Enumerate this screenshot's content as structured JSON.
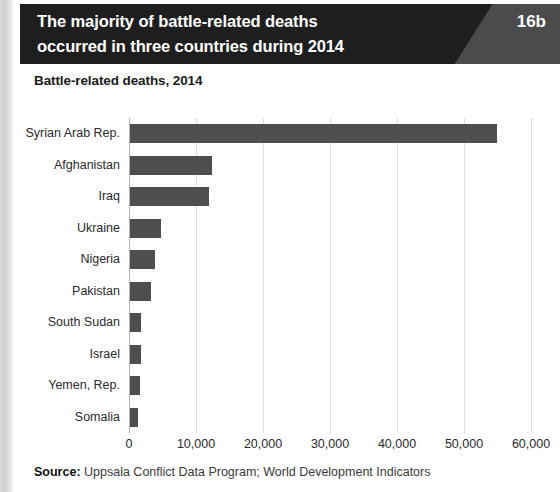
{
  "header": {
    "title_line1": "The majority of battle-related deaths",
    "title_line2": "occurred in three countries during 2014",
    "badge": "16b",
    "dark_color": "#1e1e1e",
    "badge_bg_color": "#4b4b4b"
  },
  "chart_title": "Battle-related deaths, 2014",
  "source": {
    "label": "Source:",
    "text": " Uppsala Conflict Data Program; World Development Indicators"
  },
  "chart_data": {
    "type": "bar",
    "orientation": "horizontal",
    "title": "Battle-related deaths, 2014",
    "xlabel": "",
    "ylabel": "",
    "xlim": [
      0,
      60000
    ],
    "xticks": [
      0,
      10000,
      20000,
      30000,
      40000,
      50000,
      60000
    ],
    "xtick_labels": [
      "0",
      "10,000",
      "20,000",
      "30,000",
      "40,000",
      "50,000",
      "60,000"
    ],
    "grid": "vertical",
    "legend": "none",
    "bar_color": "#4e4e4e",
    "categories": [
      "Syrian Arab Rep.",
      "Afghanistan",
      "Iraq",
      "Ukraine",
      "Nigeria",
      "Pakistan",
      "South Sudan",
      "Israel",
      "Yemen, Rep.",
      "Somalia"
    ],
    "values": [
      54800,
      12200,
      11800,
      4700,
      3750,
      3100,
      1700,
      1650,
      1450,
      1200
    ]
  }
}
